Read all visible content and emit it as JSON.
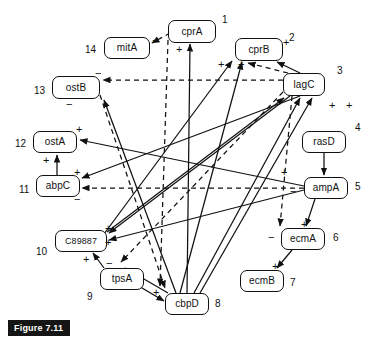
{
  "figure": {
    "caption": "Figure 7.11"
  },
  "legend": {
    "solid_meaning": "activation",
    "dashed_meaning": "repression",
    "plus": "+",
    "minus": "−"
  },
  "nodes": [
    {
      "id": "cprA",
      "label": "cprA",
      "number": "1",
      "x": 168,
      "y": 20,
      "w": 48,
      "h": 23
    },
    {
      "id": "cprB",
      "label": "cprB",
      "number": "2",
      "x": 235,
      "y": 38,
      "w": 48,
      "h": 23
    },
    {
      "id": "lagC",
      "label": "lagC",
      "number": "3",
      "x": 283,
      "y": 73,
      "w": 42,
      "h": 23
    },
    {
      "id": "rasD",
      "label": "rasD",
      "number": "4",
      "x": 302,
      "y": 131,
      "w": 44,
      "h": 22
    },
    {
      "id": "ampA",
      "label": "ampA",
      "number": "5",
      "x": 304,
      "y": 177,
      "w": 44,
      "h": 22
    },
    {
      "id": "ecmA",
      "label": "ecmA",
      "number": "6",
      "x": 281,
      "y": 228,
      "w": 44,
      "h": 22
    },
    {
      "id": "ecmB",
      "label": "ecmB",
      "number": "7",
      "x": 240,
      "y": 270,
      "w": 44,
      "h": 22
    },
    {
      "id": "cbpD",
      "label": "cbpD",
      "number": "8",
      "x": 165,
      "y": 293,
      "w": 44,
      "h": 22
    },
    {
      "id": "tpsA",
      "label": "tpsA",
      "number": "9",
      "x": 100,
      "y": 268,
      "w": 44,
      "h": 22
    },
    {
      "id": "C89887",
      "label": "C89887",
      "number": "10",
      "x": 55,
      "y": 230,
      "w": 52,
      "h": 22
    },
    {
      "id": "abpC",
      "label": "abpC",
      "number": "11",
      "x": 36,
      "y": 175,
      "w": 44,
      "h": 22
    },
    {
      "id": "ostA",
      "label": "ostA",
      "number": "12",
      "x": 33,
      "y": 131,
      "w": 44,
      "h": 22
    },
    {
      "id": "ostB",
      "label": "ostB",
      "number": "13",
      "x": 52,
      "y": 76,
      "w": 48,
      "h": 23
    },
    {
      "id": "mitA",
      "label": "mitA",
      "number": "14",
      "x": 104,
      "y": 37,
      "w": 46,
      "h": 22
    }
  ],
  "number_labels": [
    {
      "text": "1",
      "x": 222,
      "y": 14
    },
    {
      "text": "2",
      "x": 289,
      "y": 32
    },
    {
      "text": "3",
      "x": 337,
      "y": 65
    },
    {
      "text": "4",
      "x": 355,
      "y": 122
    },
    {
      "text": "5",
      "x": 355,
      "y": 181
    },
    {
      "text": "6",
      "x": 333,
      "y": 232
    },
    {
      "text": "7",
      "x": 290,
      "y": 277
    },
    {
      "text": "8",
      "x": 215,
      "y": 298
    },
    {
      "text": "9",
      "x": 87,
      "y": 291
    },
    {
      "text": "10",
      "x": 36,
      "y": 246
    },
    {
      "text": "11",
      "x": 19,
      "y": 184
    },
    {
      "text": "12",
      "x": 15,
      "y": 138
    },
    {
      "text": "13",
      "x": 34,
      "y": 85
    },
    {
      "text": "14",
      "x": 85,
      "y": 44
    }
  ],
  "signs": [
    {
      "text": "−",
      "x": 152,
      "y": 35,
      "for": "mitA-in-from-cprA"
    },
    {
      "text": "+",
      "x": 176,
      "y": 44,
      "for": "cprA-in-from-cbpD"
    },
    {
      "text": "+",
      "x": 218,
      "y": 59,
      "for": "cprB-in-left"
    },
    {
      "text": "+",
      "x": 238,
      "y": 59,
      "for": "cprB-in-center"
    },
    {
      "text": "+",
      "x": 283,
      "y": 37,
      "for": "cprB-in-from-lagC"
    },
    {
      "text": "−",
      "x": 95,
      "y": 68,
      "for": "ostB-in-dashed-from-lagC"
    },
    {
      "text": "−",
      "x": 66,
      "y": 99,
      "for": "ostB-in-bottom"
    },
    {
      "text": "+",
      "x": 76,
      "y": 124,
      "for": "ostA-in-right"
    },
    {
      "text": "+",
      "x": 43,
      "y": 155,
      "for": "ostA-in-from-abpC"
    },
    {
      "text": "+",
      "x": 74,
      "y": 167,
      "for": "abpC-in-top"
    },
    {
      "text": "−",
      "x": 74,
      "y": 194,
      "for": "abpC-in-dashed-from-ampA"
    },
    {
      "text": "+",
      "x": 105,
      "y": 223,
      "for": "C89887-in-top"
    },
    {
      "text": "+",
      "x": 105,
      "y": 237,
      "for": "C89887-in-right"
    },
    {
      "text": "+",
      "x": 83,
      "y": 254,
      "for": "C89887-in-from-tpsA"
    },
    {
      "text": "−",
      "x": 106,
      "y": 258,
      "for": "tpsA-in-top"
    },
    {
      "text": "+",
      "x": 153,
      "y": 287,
      "for": "cbpD-in-from-tpsA"
    },
    {
      "text": "+",
      "x": 281,
      "y": 167,
      "for": "ampA-in-from-rasD"
    },
    {
      "text": "−",
      "x": 290,
      "y": 186,
      "for": "ampA-left-edge"
    },
    {
      "text": "+",
      "x": 301,
      "y": 219,
      "for": "ecmA-in-from-ampA"
    },
    {
      "text": "−",
      "x": 268,
      "y": 232,
      "for": "ecmA-in-dashed"
    },
    {
      "text": "+",
      "x": 272,
      "y": 261,
      "for": "ecmB-in-from-ecmA"
    },
    {
      "text": "+",
      "x": 329,
      "y": 100,
      "for": "lagC-in-left"
    },
    {
      "text": "+",
      "x": 346,
      "y": 100,
      "for": "lagC-in-right"
    }
  ],
  "edges": [
    {
      "from": "cprA",
      "to": "mitA",
      "sign": "−",
      "style": "dashed"
    },
    {
      "from": "cbpD",
      "to": "cprA",
      "sign": "+",
      "style": "solid"
    },
    {
      "from": "lagC",
      "to": "cprB",
      "sign": "+",
      "style": "solid"
    },
    {
      "from": "cbpD",
      "to": "cprB",
      "sign": "+",
      "style": "solid"
    },
    {
      "from": "C89887",
      "to": "cprB",
      "sign": "+",
      "style": "solid"
    },
    {
      "from": "lagC",
      "to": "ostB",
      "sign": "−",
      "style": "dashed"
    },
    {
      "from": "cbpD",
      "to": "ostB",
      "sign": "−",
      "style": "solid"
    },
    {
      "from": "ampA",
      "to": "ostA",
      "sign": "+",
      "style": "solid"
    },
    {
      "from": "abpC",
      "to": "ostA",
      "sign": "+",
      "style": "solid"
    },
    {
      "from": "lagC",
      "to": "abpC",
      "sign": "+",
      "style": "solid"
    },
    {
      "from": "ampA",
      "to": "abpC",
      "sign": "−",
      "style": "dashed"
    },
    {
      "from": "lagC",
      "to": "C89887",
      "sign": "+",
      "style": "solid"
    },
    {
      "from": "ampA",
      "to": "C89887",
      "sign": "+",
      "style": "solid"
    },
    {
      "from": "tpsA",
      "to": "C89887",
      "sign": "+",
      "style": "solid"
    },
    {
      "from": "cbpD",
      "to": "tpsA",
      "sign": "−",
      "style": "solid"
    },
    {
      "from": "tpsA",
      "to": "cbpD",
      "sign": "+",
      "style": "solid"
    },
    {
      "from": "rasD",
      "to": "ampA",
      "sign": "+",
      "style": "solid"
    },
    {
      "from": "ampA",
      "to": "ecmA",
      "sign": "+",
      "style": "solid"
    },
    {
      "from": "lagC",
      "to": "ecmA",
      "sign": "−",
      "style": "dashed"
    },
    {
      "from": "ecmA",
      "to": "ecmB",
      "sign": "+",
      "style": "solid"
    },
    {
      "from": "cbpD",
      "to": "lagC",
      "sign": "+",
      "style": "solid"
    },
    {
      "from": "C89887",
      "to": "lagC",
      "sign": "+",
      "style": "solid"
    }
  ]
}
